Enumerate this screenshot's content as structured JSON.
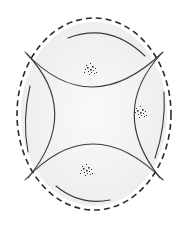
{
  "diagram": {
    "type": "schematic-line-drawing",
    "background": "#ffffff",
    "fill_tint": "#f2f2f2",
    "stroke_color": "#3a3a3a",
    "dash_color": "#2a2a2a",
    "boundary": {
      "shape": "dashed-oval",
      "cx": 94,
      "cy": 114,
      "rx": 77,
      "ry": 96
    },
    "inner_arcs": [
      {
        "name": "top-arc",
        "d": "M68,38 Q110,22 145,56"
      },
      {
        "name": "left-arc",
        "d": "M30,86 Q22,120 28,152"
      },
      {
        "name": "right-arc",
        "d": "M164,92 Q166,126 155,158"
      },
      {
        "name": "bottom-arc",
        "d": "M56,186 Q80,206 110,200"
      }
    ],
    "hyperbola_curves": [
      {
        "name": "upper-branch",
        "d": "M25,52 Q90,122 163,52"
      },
      {
        "name": "lower-branch",
        "d": "M25,180 Q92,108 163,180"
      },
      {
        "name": "left-branch",
        "d": "M27,54 Q82,112 28,178"
      },
      {
        "name": "right-branch",
        "d": "M161,54 Q108,112 160,178"
      }
    ],
    "stipple_clusters": [
      {
        "name": "top-cluster",
        "cx": 90,
        "cy": 69
      },
      {
        "name": "right-cluster",
        "cx": 140,
        "cy": 112
      },
      {
        "name": "bottom-cluster",
        "cx": 86,
        "cy": 170
      }
    ]
  }
}
